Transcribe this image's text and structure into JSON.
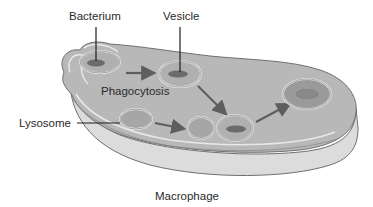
{
  "diagram": {
    "title": "Macrophage",
    "labels": {
      "bacterium": "Bacterium",
      "vesicle": "Vesicle",
      "phagocytosis": "Phagocytosis",
      "lysosome": "Lysosome",
      "macrophage": "Macrophage"
    },
    "colors": {
      "cell_fill": "#b4b4b4",
      "cell_top": "#bdbdbd",
      "cell_side": "#d9d9d9",
      "cell_outline": "#6f6f6f",
      "membrane_inner": "#e6e6e6",
      "bacterium": "#6b6b6b",
      "arrow": "#5e5e5e",
      "text": "#2a2a2a"
    }
  }
}
